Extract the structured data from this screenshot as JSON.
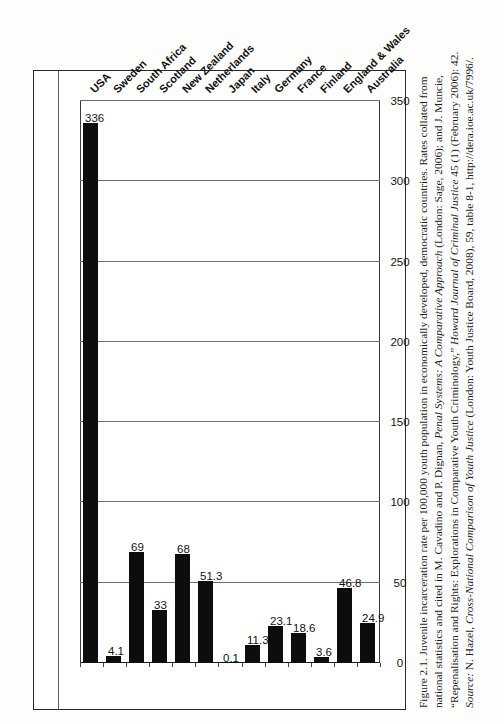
{
  "figure": {
    "caption_lines": [
      "Figure 2.1. Juvenile incarceration rate per 100,000 youth population in economically developed, democratic countries. Rates collated from",
      "national statistics and cited in M. Cavadino and P. Dignan, Penal Systems: A Comparative Approach (London: Sage, 2006); and J. Muncie,",
      "“Repenalisation and Rights: Explorations in Comparative Youth Criminology,” Howard Journal of Criminal Justice 45 (1) (February 2006): 42.",
      "Source: N. Hazel, Cross-National Comparison of Youth Justice (London: Youth Justice Board, 2008), 59, table 8-1, http://dera.ioe.ac.uk/7996/."
    ],
    "caption_line1_a": "Figure 2.1. Juvenile incarceration rate per 100,000 youth population in economically developed, democratic countries. Rates collated from",
    "caption_line2_a": "national statistics and cited in M. Cavadino and P. Dignan, ",
    "caption_line2_it": "Penal Systems: A Comparative Approach",
    "caption_line2_b": " (London: Sage, 2006); and J. Muncie,",
    "caption_line3_a": "“Repenalisation and Rights: Explorations in Comparative Youth Criminology,” ",
    "caption_line3_it": "Howard Journal of Criminal Justice",
    "caption_line3_b": " 45 (1) (February 2006): 42.",
    "caption_line4_it1": "Source:",
    "caption_line4_a": " N. Hazel, ",
    "caption_line4_it2": "Cross-National Comparison of Youth Justice",
    "caption_line4_b": " (London: Youth Justice Board, 2008), 59, table 8-1, http://dera.ioe.ac.uk/7996/."
  },
  "chart_data": {
    "type": "bar",
    "orientation": "horizontal",
    "title": "",
    "xlabel": "",
    "ylabel": "",
    "xlim": [
      0,
      350
    ],
    "grid": true,
    "legend": "none",
    "bar_color": "#0d0d0d",
    "categories": [
      "Australia",
      "England & Wales",
      "Finland",
      "France",
      "Germany",
      "Italy",
      "Japan",
      "Netherlands",
      "New Zealand",
      "Scotland",
      "South Africa",
      "Sweden",
      "USA"
    ],
    "values": [
      24.9,
      46.8,
      3.6,
      18.6,
      23.1,
      11.3,
      0.1,
      51.3,
      68,
      33,
      69,
      4.1,
      336
    ],
    "value_labels": [
      "24.9",
      "46.8",
      "3.6",
      "18.6",
      "23.1",
      "11.3",
      "0.1",
      "51.3",
      "68",
      "33",
      "69",
      "4.1",
      "336"
    ],
    "axis_ticks": [
      0,
      50,
      100,
      150,
      200,
      250,
      300,
      350
    ],
    "axis_tick_labels": [
      "0",
      "50",
      "100",
      "150",
      "200",
      "250",
      "300",
      "350"
    ]
  }
}
